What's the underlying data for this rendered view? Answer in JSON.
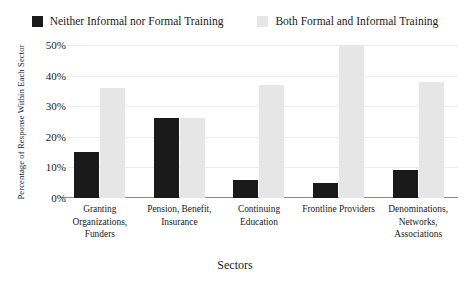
{
  "legend": {
    "entries": [
      {
        "label": "Neither Informal nor Formal Training",
        "color": "#1a1a1a",
        "swatch_name": "legend-swatch-dark"
      },
      {
        "label": "Both Formal and Informal Training",
        "color": "#e6e6e6",
        "swatch_name": "legend-swatch-light"
      }
    ]
  },
  "axes": {
    "y_title": "Percentage of Response Within Each Sector",
    "x_title": "Sectors",
    "y_ticks": [
      "0%",
      "10%",
      "20%",
      "30%",
      "40%",
      "50%"
    ]
  },
  "chart_data": {
    "type": "bar",
    "title": "",
    "xlabel": "Sectors",
    "ylabel": "Percentage of Response Within Each Sector",
    "ylim": [
      0,
      50
    ],
    "ytick_values": [
      0,
      10,
      20,
      30,
      40,
      50
    ],
    "ytick_labels": [
      "0%",
      "10%",
      "20%",
      "30%",
      "40%",
      "50%"
    ],
    "grid": true,
    "legend_position": "top-center",
    "categories": [
      "Granting Organizations, Funders",
      "Pension, Benefit, Insurance",
      "Continuing Education",
      "Frontline Providers",
      "Denominations, Networks, Associations"
    ],
    "series": [
      {
        "name": "Neither Informal nor Formal Training",
        "color": "#1a1a1a",
        "values": [
          15,
          26,
          6,
          5,
          9
        ]
      },
      {
        "name": "Both Formal and Informal Training",
        "color": "#e6e6e6",
        "values": [
          36,
          26,
          37,
          50,
          38
        ]
      }
    ]
  }
}
